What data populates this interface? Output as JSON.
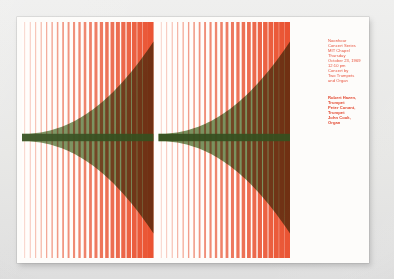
{
  "poster": {
    "title": "Noonhour Concert Series",
    "event": {
      "lines": [
        "Noonhour",
        "Concert Series",
        "MIT Chapel",
        "Thursday",
        "October 23, 1969",
        "12:10 pm",
        "Concert by",
        "Two Trumpets",
        "and Organ"
      ]
    },
    "credits": {
      "lines": [
        "Robert Hazen,",
        "Trumpet",
        "Peter Conant,",
        "Trumpet",
        "John Cook,",
        "Organ"
      ]
    },
    "colors": {
      "orange": "#ea5332",
      "orange_light": "#f6bfae",
      "green": "#6f8a52",
      "wedge": "#9c5434",
      "paper": "#fdfcfa",
      "text_red": "#e8503a",
      "backdrop": "#e9e9e7"
    },
    "artwork": {
      "type": "stripe-gradient",
      "panels": 2,
      "description": "Two panels of vertical orange stripes increasing in width and saturation left to right, overlaid by a horizontal green band and a dark triangular wedge opening to the right."
    }
  }
}
